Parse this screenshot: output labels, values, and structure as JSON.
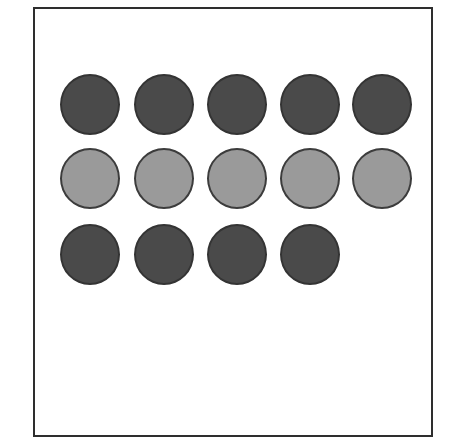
{
  "figure": {
    "background_color": "#ffffff",
    "frame": {
      "border_color": "#2e2e2e",
      "border_width_px": 2,
      "left_px": 33,
      "top_px": 7,
      "width_px": 400,
      "visible_bottom": false
    }
  },
  "chart_data": {
    "type": "scatter",
    "title": "",
    "subtitle": "",
    "xlabel": "",
    "ylabel": "",
    "legend": [],
    "grid": false,
    "columns": 5,
    "rows": 3,
    "total_circles": 14,
    "circle_diameter_px": 60,
    "column_pitch_px": 73,
    "row_pitch_px": 75,
    "palette": {
      "dark_fill": "#4a4a4a",
      "dark_outline": "#343434",
      "light_fill": "#9a9a9a",
      "light_outline": "#3c3c3c"
    },
    "row_labels": [
      "row-1",
      "row-2",
      "row-3"
    ],
    "counts_per_row": [
      5,
      5,
      4
    ],
    "counts_per_shade": {
      "dark": 9,
      "light": 5
    },
    "cells": [
      [
        {
          "present": true,
          "shade": "dark",
          "fill": "#4a4a4a",
          "outline": "#343434"
        },
        {
          "present": true,
          "shade": "dark",
          "fill": "#4a4a4a",
          "outline": "#343434"
        },
        {
          "present": true,
          "shade": "dark",
          "fill": "#4a4a4a",
          "outline": "#343434"
        },
        {
          "present": true,
          "shade": "dark",
          "fill": "#4a4a4a",
          "outline": "#343434"
        },
        {
          "present": true,
          "shade": "dark",
          "fill": "#4a4a4a",
          "outline": "#343434"
        }
      ],
      [
        {
          "present": true,
          "shade": "light",
          "fill": "#9a9a9a",
          "outline": "#3c3c3c"
        },
        {
          "present": true,
          "shade": "light",
          "fill": "#9a9a9a",
          "outline": "#3c3c3c"
        },
        {
          "present": true,
          "shade": "light",
          "fill": "#9a9a9a",
          "outline": "#3c3c3c"
        },
        {
          "present": true,
          "shade": "light",
          "fill": "#9a9a9a",
          "outline": "#3c3c3c"
        },
        {
          "present": true,
          "shade": "light",
          "fill": "#9a9a9a",
          "outline": "#3c3c3c"
        }
      ],
      [
        {
          "present": true,
          "shade": "dark",
          "fill": "#4a4a4a",
          "outline": "#343434"
        },
        {
          "present": true,
          "shade": "dark",
          "fill": "#4a4a4a",
          "outline": "#343434"
        },
        {
          "present": true,
          "shade": "dark",
          "fill": "#4a4a4a",
          "outline": "#343434"
        },
        {
          "present": true,
          "shade": "dark",
          "fill": "#4a4a4a",
          "outline": "#343434"
        },
        {
          "present": false,
          "shade": "none",
          "fill": "",
          "outline": ""
        }
      ]
    ]
  }
}
